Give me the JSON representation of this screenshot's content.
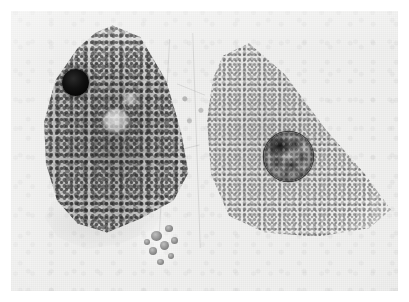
{
  "figure": {
    "kind": "light-micrograph",
    "modality": "brightfield / phase-contrast grayscale photomicrograph",
    "orientation": "landscape",
    "width_px": 409,
    "height_px": 302,
    "border": {
      "style": "white photographic margin",
      "color": "#ffffff",
      "inset_px": 11
    },
    "plate": {
      "background_color": "#f1f1f0",
      "grain": "fine silver-halide emulsion grain"
    },
    "visible_text": "",
    "labels": [],
    "scale_bar": null
  },
  "specimen": {
    "description": "Two adjacent cultured cells in contact, each with a single prominent nucleus",
    "cell_count": 2
  },
  "objects": {
    "left_cell": {
      "name": "left cell",
      "tone": "dark, heavily granular cytoplasm",
      "shape": "rounded triangular / teardrop",
      "center_px": [
        115,
        125
      ],
      "nucleus": {
        "name": "dark pyknotic nucleus",
        "appearance": "uniformly opaque black sphere, sharply outlined",
        "center_px": [
          75,
          82
        ],
        "diameter_px": 27,
        "fill_color": "#0a0a0a"
      },
      "vacuoles": [
        {
          "name": "pale vacuole",
          "center_px": [
            116,
            121
          ],
          "diameter_px": 25
        },
        {
          "name": "small pale vacuole",
          "center_px": [
            131,
            100
          ],
          "diameter_px": 14
        }
      ],
      "lamella": {
        "name": "thin basal lamellipodium",
        "appearance": "flat, nearly transparent membrane skirt along the lower margin"
      }
    },
    "right_cell": {
      "name": "right cell",
      "tone": "light, finely granular cytoplasm",
      "shape": "triangular, tapering to a point at right",
      "center_px": [
        286,
        130
      ],
      "apex_px": [
        210,
        32
      ],
      "nucleus": {
        "name": "mottled interphase nucleus",
        "appearance": "circular, sharp dark rim, patchy chromatin clumps with pale interchromatin spaces; densest clump at upper-left",
        "center_px": [
          277,
          145
        ],
        "diameter_px": 49,
        "rim_color": "#1a1a1a"
      }
    },
    "blebs": {
      "name": "membrane blebs / vesicle cluster",
      "appearance": "chain of small dark refractile vesicles at the lower cell junction",
      "center_px": [
        155,
        236
      ],
      "count": 8
    },
    "interstitial_zone": {
      "name": "pale interstitial zone",
      "appearance": "lighter, faintly striated region separating the two cells",
      "x_range_px": [
        150,
        215
      ]
    }
  },
  "tones": {
    "plate_background": "#f1f1f0",
    "left_cytoplasm_mid": "#8a8a8a",
    "left_cytoplasm_dark": "#4a4a4a",
    "left_nucleus": "#0a0a0a",
    "right_cytoplasm_mid": "#bdbdbd",
    "right_nucleus_mid": "#8f8f8f",
    "right_nucleus_dark": "#141414",
    "margin_white": "#ffffff"
  }
}
